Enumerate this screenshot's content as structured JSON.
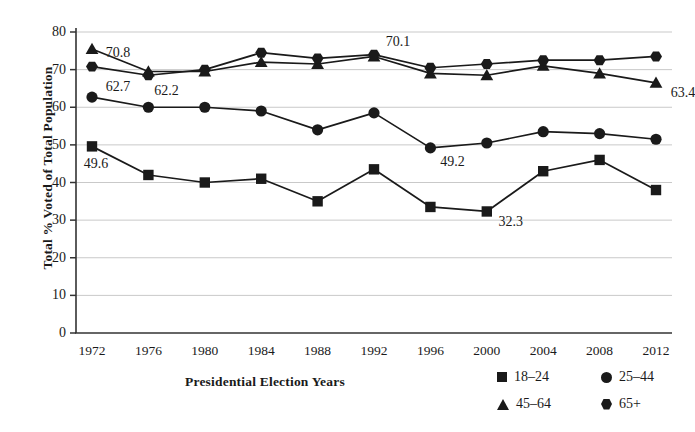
{
  "chart_data": {
    "type": "line",
    "title": "",
    "xlabel": "Presidential Election Years",
    "ylabel": "Total % Voted of Total Population",
    "categories": [
      "1972",
      "1976",
      "1980",
      "1984",
      "1988",
      "1992",
      "1996",
      "2000",
      "2004",
      "2008",
      "2012"
    ],
    "ylim": [
      0,
      80
    ],
    "yticks": [
      0,
      10,
      20,
      30,
      40,
      50,
      60,
      70,
      80
    ],
    "grid": true,
    "legend_position": "bottom-right",
    "series": [
      {
        "name": "18–24",
        "marker": "square",
        "values": [
          49.6,
          42.0,
          40.0,
          41.0,
          35.0,
          43.5,
          33.5,
          32.3,
          43.0,
          46.0,
          38.0
        ]
      },
      {
        "name": "25–44",
        "marker": "circle",
        "values": [
          62.7,
          60.0,
          60.0,
          59.0,
          54.0,
          58.5,
          49.2,
          50.5,
          53.5,
          53.0,
          51.5
        ]
      },
      {
        "name": "45–64",
        "marker": "triangle",
        "values": [
          75.5,
          69.5,
          69.5,
          72.0,
          71.5,
          73.5,
          69.0,
          68.5,
          71.0,
          69.0,
          66.5
        ]
      },
      {
        "name": "65+",
        "marker": "hexagon",
        "values": [
          70.8,
          68.5,
          70.0,
          74.5,
          73.0,
          74.0,
          70.5,
          71.5,
          72.5,
          72.5,
          73.5
        ]
      }
    ],
    "point_labels": [
      {
        "text": "70.8",
        "x": 1972,
        "y": 70.8,
        "dx": 26,
        "dy": -14
      },
      {
        "text": "62.7",
        "x": 1972,
        "y": 62.7,
        "dx": 26,
        "dy": -10
      },
      {
        "text": "62.2",
        "x": 1976,
        "y": 68.5,
        "dx": 18,
        "dy": 16
      },
      {
        "text": "49.6",
        "x": 1972,
        "y": 49.6,
        "dx": 4,
        "dy": 18
      },
      {
        "text": "70.1",
        "x": 1992,
        "y": 73.8,
        "dx": 24,
        "dy": -13
      },
      {
        "text": "49.2",
        "x": 1996,
        "y": 49.2,
        "dx": 22,
        "dy": 14
      },
      {
        "text": "32.3",
        "x": 2000,
        "y": 32.3,
        "dx": 24,
        "dy": 11
      },
      {
        "text": "63.4",
        "x": 2012,
        "y": 66.5,
        "dx": 27,
        "dy": 10
      }
    ]
  },
  "legend": {
    "items": [
      {
        "label": "18–24",
        "marker": "square"
      },
      {
        "label": "25–44",
        "marker": "circle"
      },
      {
        "label": "45–64",
        "marker": "triangle"
      },
      {
        "label": "65+",
        "marker": "hexagon"
      }
    ]
  },
  "colors": {
    "line": "#1a1a1a",
    "marker": "#1a1a1a",
    "grid": "#c9c9c9",
    "axis": "#333333",
    "text": "#1a1a1a",
    "background": "#ffffff"
  }
}
